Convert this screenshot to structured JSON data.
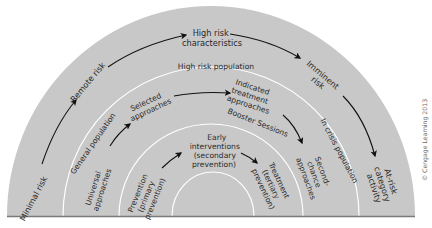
{
  "diagram": {
    "colors": {
      "fill": "#c8c8c8",
      "ring_line": "#ffffff",
      "text": "#2a2a2a",
      "arrow": "#111111",
      "baseline": "#7a7a7a",
      "copyright": "#6a6a6a"
    },
    "outer_band": {
      "stages": {
        "minimal": "Minimal risk",
        "remote": "Remote risk",
        "high": [
          "High risk",
          "characteristics"
        ],
        "imminent": [
          "Imminent",
          "risk"
        ],
        "atrisk": [
          "At-risk",
          "category",
          "activity"
        ]
      }
    },
    "population_rings": {
      "general": "General population",
      "high_risk": "High risk population",
      "in_crisis": "In crisis population"
    },
    "approaches_band": {
      "universal": [
        "Universal",
        "approaches"
      ],
      "selected": [
        "Selected",
        "approaches"
      ],
      "indicated": [
        "Indicated",
        "treatment",
        "approaches"
      ],
      "booster": "Booster Sessions",
      "second_chance": [
        "Second-",
        "chance",
        "approaches"
      ]
    },
    "prevention_band": {
      "primary": [
        "Prevention",
        "(primary",
        "prevention)"
      ],
      "secondary": [
        "Early",
        "interventions",
        "(secondary",
        "prevention)"
      ],
      "tertiary": [
        "Treatment",
        "(tertiary",
        "prevention)"
      ]
    },
    "copyright": "© Cengage Learning 2013"
  }
}
